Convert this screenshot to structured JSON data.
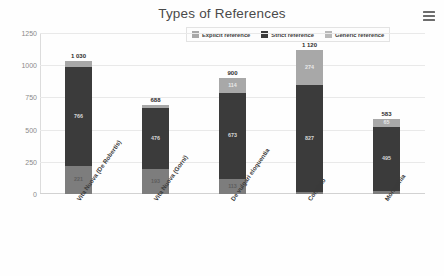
{
  "header": {
    "title": "Types of References",
    "menu_icon": "hamburger-menu-icon"
  },
  "colors": {
    "explicit": "#a8a8a8",
    "strict": "#3b3b3b",
    "generic": "#7d7d7d",
    "gridline": "#e9e9e9",
    "axis_text": "#8a8a8a",
    "title_text": "#4a4a4a"
  },
  "chart_data": {
    "type": "bar",
    "subtype": "stacked-bar",
    "title": "Types of References",
    "xlabel": "",
    "ylabel": "Distribution",
    "ylim": [
      0,
      1250
    ],
    "yticks": [
      1250,
      1000,
      750,
      500,
      250,
      0
    ],
    "grid": true,
    "legend_position": "top-center",
    "categories": [
      "Vita Nuova (De Robertis)",
      "Vita Nuova (Gorni)",
      "De vulgari eloquentia",
      "Convivio",
      "Monarchia"
    ],
    "series": [
      {
        "name": "Generic reference",
        "values": [
          221,
          193,
          113,
          19,
          23
        ]
      },
      {
        "name": "Strict reference",
        "values": [
          766,
          476,
          673,
          827,
          495
        ]
      },
      {
        "name": "Explicit reference",
        "values": [
          43,
          19,
          114,
          274,
          65
        ]
      }
    ],
    "totals": [
      1030,
      688,
      900,
      1120,
      583
    ],
    "totals_display": [
      "1 030",
      "688",
      "900",
      "1 120",
      "583"
    ],
    "segment_labels": {
      "generic": [
        "221",
        "193",
        "113",
        "19",
        "23"
      ],
      "strict": [
        "766",
        "476",
        "673",
        "827",
        "495"
      ],
      "explicit": [
        "43",
        "19",
        "114",
        "274",
        "65"
      ]
    }
  },
  "legend": {
    "items": [
      {
        "label": "Explicit reference",
        "color": "#a8a8a8"
      },
      {
        "label": "Strict reference",
        "color": "#3b3b3b"
      },
      {
        "label": "Generic reference",
        "color": "#b9b9b9"
      }
    ]
  }
}
